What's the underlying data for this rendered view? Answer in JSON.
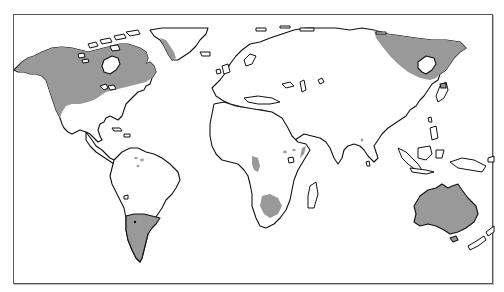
{
  "map": {
    "type": "world-map",
    "projection": "equirectangular-like",
    "land_fill": "#ffffff",
    "outline_color": "#111111",
    "shaded_color": "#999999",
    "frame_color": "#555555",
    "shaded_regions": [
      {
        "name": "North America (Alaska, Canada, western United States)"
      },
      {
        "name": "Eastern Greenland coast"
      },
      {
        "name": "Northeastern Siberia / Russian Far East"
      },
      {
        "name": "Southern South America (Argentina, Patagonia)"
      },
      {
        "name": "Australia"
      },
      {
        "name": "Southern Africa (Kalahari patch)"
      },
      {
        "name": "West-central Africa coastal patch"
      },
      {
        "name": "East Africa small patches"
      },
      {
        "name": "Northern South America small patches"
      }
    ],
    "legend": null,
    "title": null
  }
}
